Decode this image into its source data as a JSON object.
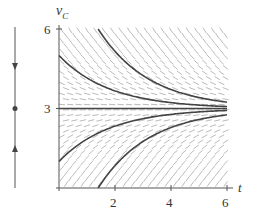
{
  "figure": {
    "type": "slope-field-with-phase-line",
    "y_axis": {
      "label": "v",
      "label_subscript": "C",
      "ticks": [
        {
          "value": 6,
          "label": "6"
        },
        {
          "value": 3,
          "label": "3"
        }
      ]
    },
    "x_axis": {
      "label": "t",
      "ticks": [
        {
          "value": 2,
          "label": "2"
        },
        {
          "value": 4,
          "label": "4"
        },
        {
          "value": 6,
          "label": "6"
        }
      ]
    },
    "equilibrium": 3,
    "phase_line": {
      "equilibrium_dot": 3,
      "arrow_above": "down",
      "arrow_below": "up"
    },
    "solutions": [
      {
        "name": "above-from-top",
        "t0": 1.4,
        "v0": 6
      },
      {
        "name": "above-from-5",
        "t0": 0,
        "v0": 5
      },
      {
        "name": "equilibrium",
        "t0": 0,
        "v0": 3
      },
      {
        "name": "below-from-1",
        "t0": 0,
        "v0": 1
      },
      {
        "name": "below-from-bottom",
        "t0": 1.4,
        "v0": 0
      }
    ],
    "colors": {
      "curve": "#444444",
      "slope": "#bbbbbb",
      "axis": "#555555"
    }
  }
}
